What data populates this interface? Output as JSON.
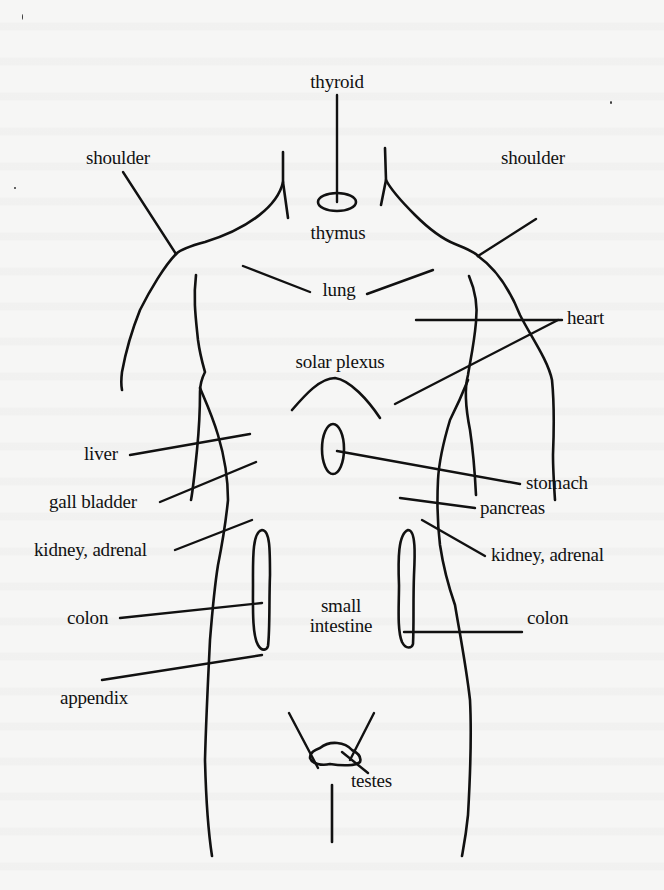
{
  "diagram": {
    "type": "anatomical reflex map",
    "stroke_color": "#111111",
    "background_color": "#f6f6f5",
    "labels": {
      "thyroid": "thyroid",
      "shoulder_left": "shoulder",
      "shoulder_right": "shoulder",
      "thymus": "thymus",
      "lung": "lung",
      "heart": "heart",
      "solar_plexus": "solar plexus",
      "liver": "liver",
      "stomach": "stomach",
      "gall_bladder": "gall bladder",
      "pancreas": "pancreas",
      "kidney_adrenal_left": "kidney, adrenal",
      "kidney_adrenal_right": "kidney, adrenal",
      "colon_left": "colon",
      "colon_right": "colon",
      "small_intestine_line1": "small",
      "small_intestine_line2": "intestine",
      "appendix": "appendix",
      "testes": "testes"
    }
  }
}
